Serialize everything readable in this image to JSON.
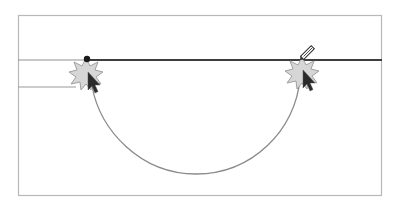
{
  "diagram": {
    "colors": {
      "background": "#ffffff",
      "frame": "#b8b8b8",
      "guide_line_light": "#9a9a9a",
      "path_line": "#444444",
      "curve": "#8a8a8a",
      "anchor": "#1a1a1a",
      "burst_fill": "#d6d6d6",
      "burst_stroke": "#9c9c9c",
      "cursor": "#2a2a2a"
    },
    "frame": {
      "x": 18,
      "y": 15,
      "width": 364,
      "height": 181
    },
    "guide_line_y": 60,
    "secondary_line": {
      "x1": 18,
      "x2": 76,
      "y": 87
    },
    "anchor_point": {
      "x": 87,
      "y": 59
    },
    "curve": {
      "start": [
        92,
        88
      ],
      "end": [
        300,
        78
      ],
      "bottom": [
        196,
        174
      ]
    },
    "click_markers": [
      {
        "name": "click-start",
        "x": 86,
        "y": 74
      },
      {
        "name": "click-end",
        "x": 302,
        "y": 73
      }
    ],
    "pen_tool": {
      "x": 304,
      "y": 54
    }
  }
}
